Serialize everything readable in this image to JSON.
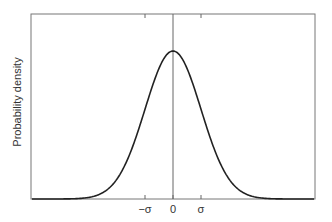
{
  "chart_data": {
    "type": "line",
    "title": "",
    "xlabel": "",
    "ylabel": "Probability density",
    "x_tick_labels": [
      "−σ",
      "0",
      "σ"
    ],
    "x_tick_positions": [
      -1,
      0,
      1
    ],
    "series": [
      {
        "name": "Normal distribution",
        "function": "gaussian",
        "mean": 0,
        "sigma": 1
      }
    ],
    "xlim": [
      -4.5,
      5.2
    ],
    "grid": false,
    "legend": false,
    "vertical_line_at": 0,
    "colors": {
      "curve": "#222222",
      "axes": "#666666"
    }
  }
}
